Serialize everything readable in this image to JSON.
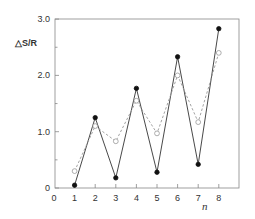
{
  "chart_data": {
    "type": "line",
    "title": "",
    "xlabel": "n",
    "ylabel": "△S/R",
    "x": [
      1,
      2,
      3,
      4,
      5,
      6,
      7,
      8
    ],
    "xlim": [
      0,
      9
    ],
    "ylim": [
      0,
      3.0
    ],
    "xticks": [
      "0",
      "1",
      "2",
      "3",
      "4",
      "5",
      "6",
      "7",
      "8"
    ],
    "yticks": [
      "0",
      "1.0",
      "2.0",
      "3.0"
    ],
    "grid": false,
    "legend": null,
    "series": [
      {
        "name": "filled markers (solid line)",
        "style": "solid",
        "marker": "filled-circle",
        "values": [
          0.05,
          1.25,
          0.18,
          1.77,
          0.28,
          2.33,
          0.42,
          2.83
        ]
      },
      {
        "name": "open markers (dashed line)",
        "style": "dashed",
        "marker": "open-circle",
        "values": [
          0.3,
          1.1,
          0.83,
          1.55,
          0.97,
          2.0,
          1.17,
          2.4
        ]
      }
    ]
  }
}
